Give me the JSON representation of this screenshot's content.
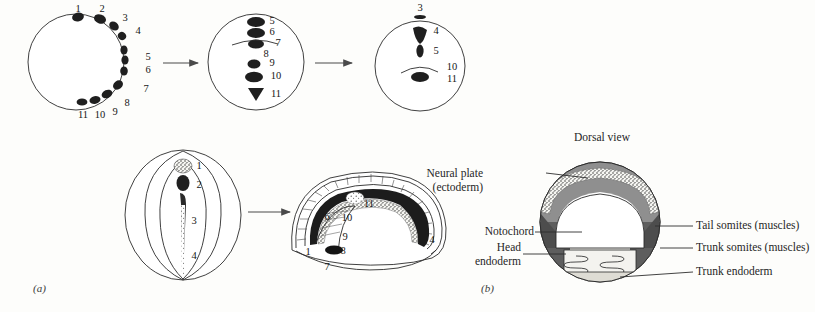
{
  "figure": {
    "panel_a": {
      "tag": "(a)",
      "stage1": {
        "name": "blastula-fate-map",
        "numbers": [
          "1",
          "2",
          "3",
          "4",
          "5",
          "6",
          "7",
          "8",
          "9",
          "10",
          "11"
        ]
      },
      "stage2": {
        "name": "gastrula-involution",
        "numbers": [
          "5",
          "6",
          "7",
          "8",
          "9",
          "10",
          "11"
        ]
      },
      "stage3": {
        "name": "late-gastrula",
        "numbers": [
          "3",
          "4",
          "5",
          "10",
          "11"
        ]
      },
      "stage4": {
        "name": "neurula-dorsal-view",
        "numbers": [
          "1",
          "2",
          "3",
          "4"
        ]
      },
      "stage5": {
        "name": "tailbud-embryo-section",
        "numbers": [
          "1",
          "6",
          "7",
          "8",
          "9",
          "10",
          "11",
          "4"
        ]
      }
    },
    "panel_b": {
      "tag": "(b)",
      "title": "Dorsal view",
      "labels": [
        {
          "id": "neural-plate",
          "line1": "Neural plate",
          "line2": "(ectoderm)"
        },
        {
          "id": "notochord",
          "line1": "Notochord",
          "line2": ""
        },
        {
          "id": "head-endoderm",
          "line1": "Head",
          "line2": "endoderm"
        },
        {
          "id": "tail-somites",
          "line1": "Tail somites (muscles)",
          "line2": ""
        },
        {
          "id": "trunk-somites",
          "line1": "Trunk somites (muscles)",
          "line2": ""
        },
        {
          "id": "trunk-endoderm",
          "line1": "Trunk endoderm",
          "line2": ""
        }
      ],
      "colors": {
        "neural_plate": "#8f8f8f",
        "notochord_band": "#b8b8b8",
        "somites": "#5e5e5e",
        "head_endoderm": "#f2f2ee",
        "trunk_endoderm": "#dedcd4",
        "outline": "#2b2b2b"
      }
    }
  }
}
